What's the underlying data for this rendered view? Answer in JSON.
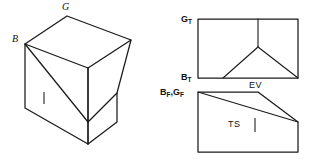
{
  "figure": {
    "background_color": "#ffffff",
    "line_color": "#1a1a1a",
    "tick_color": "#666666",
    "isometric_view": {
      "name": "isometric-pictorial",
      "labels": {
        "top_vertex": "G",
        "left_vertex": "B"
      },
      "tick_mark": "|"
    },
    "top_view": {
      "name": "top-orthographic-view",
      "labels": {
        "top_left_corner": "G",
        "top_left_corner_sub": "T",
        "bottom_left_corner": "B",
        "bottom_left_corner_sub": "T",
        "view_caption": "EV"
      }
    },
    "front_view": {
      "name": "front-orthographic-view",
      "labels": {
        "top_left_corner": "B",
        "top_left_corner_sub": "F",
        "top_left_corner_2": "G",
        "top_left_corner_2_sub": "F",
        "separator": ",",
        "view_caption": "TS"
      },
      "tick_mark": "|"
    }
  }
}
